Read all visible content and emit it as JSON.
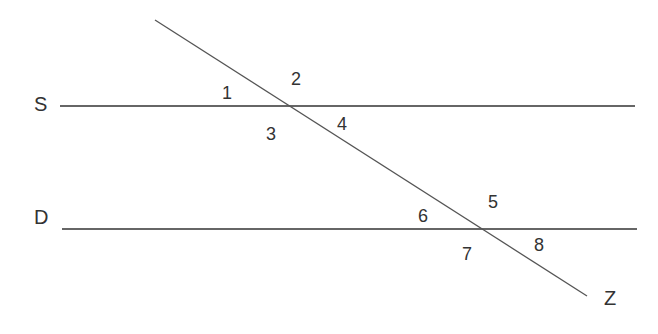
{
  "diagram": {
    "lines": {
      "S": {
        "label": "S",
        "x1": 60,
        "y1": 106,
        "x2": 635,
        "y2": 106
      },
      "D": {
        "label": "D",
        "x1": 62,
        "y1": 229,
        "x2": 637,
        "y2": 229
      },
      "Z": {
        "label": "Z",
        "x1": 155,
        "y1": 20,
        "x2": 587,
        "y2": 296
      }
    },
    "line_labels": [
      {
        "text": "S",
        "x": 34,
        "y": 94
      },
      {
        "text": "D",
        "x": 34,
        "y": 207
      },
      {
        "text": "Z",
        "x": 604,
        "y": 288
      }
    ],
    "angles": [
      {
        "text": "1",
        "x": 222,
        "y": 84
      },
      {
        "text": "2",
        "x": 291,
        "y": 70
      },
      {
        "text": "3",
        "x": 266,
        "y": 125
      },
      {
        "text": "4",
        "x": 337,
        "y": 115
      },
      {
        "text": "5",
        "x": 488,
        "y": 193
      },
      {
        "text": "6",
        "x": 418,
        "y": 207
      },
      {
        "text": "7",
        "x": 462,
        "y": 245
      },
      {
        "text": "8",
        "x": 534,
        "y": 236
      }
    ],
    "colors": {
      "line": "#333333",
      "transversal": "#555555",
      "text": "#333333"
    }
  }
}
